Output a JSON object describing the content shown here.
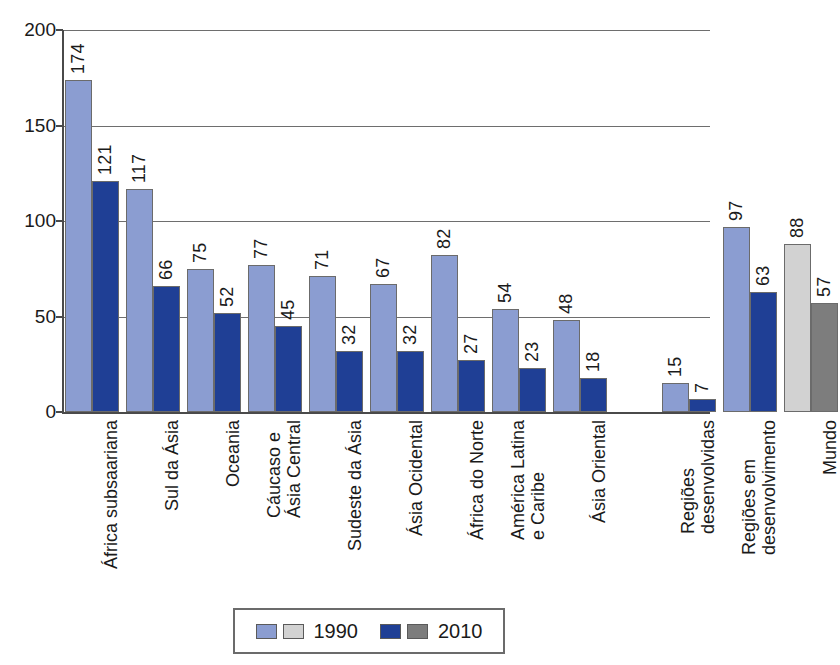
{
  "chart_data": {
    "type": "bar",
    "title": "",
    "subtitle": "",
    "xlabel": "",
    "ylabel": "",
    "ylim": [
      0,
      200
    ],
    "yticks": [
      0,
      50,
      100,
      150,
      200
    ],
    "grid": true,
    "legend_position": "bottom",
    "categories": [
      "África subsaariana",
      "Sul da Ásia",
      "Oceania",
      "Cáucaso e Ásia Central",
      "Sudeste da Ásia",
      "Ásia Ocidental",
      "África do Norte",
      "América Latina e Caribe",
      "Ásia Oriental",
      "Regiões desenvolvidas",
      "Regiões em desenvolvimento",
      "Mundo"
    ],
    "category_lines": [
      [
        "África subsaariana"
      ],
      [
        "Sul da Ásia"
      ],
      [
        "Oceania"
      ],
      [
        "Cáucaso e",
        "Ásia Central"
      ],
      [
        "Sudeste da Ásia"
      ],
      [
        "Ásia Ocidental"
      ],
      [
        "África do Norte"
      ],
      [
        "América Latina",
        "e Caribe"
      ],
      [
        "Ásia Oriental"
      ],
      [
        "Regiões",
        "desenvolvidas"
      ],
      [
        "Regiões em",
        "desenvolvimento"
      ],
      [
        "Mundo"
      ]
    ],
    "series": [
      {
        "name": "1990",
        "color": "#8b9dd1",
        "alt_color": "#d2d2d2",
        "values": [
          174,
          117,
          75,
          77,
          71,
          67,
          82,
          54,
          48,
          15,
          97,
          88
        ]
      },
      {
        "name": "2010",
        "color": "#1f3f95",
        "alt_color": "#7d7d7d",
        "values": [
          121,
          66,
          52,
          45,
          32,
          32,
          27,
          23,
          18,
          7,
          63,
          57
        ]
      }
    ],
    "gray_category_indexes": [
      11
    ],
    "gap_before_category_index": 9
  },
  "legend": {
    "items": [
      {
        "label": "1990",
        "swatch_blue": "#8b9dd1",
        "swatch_gray": "#d2d2d2"
      },
      {
        "label": "2010",
        "swatch_blue": "#1f3f95",
        "swatch_gray": "#7d7d7d"
      }
    ]
  },
  "axis": {
    "y_tick_labels": [
      "200",
      "150",
      "100",
      "50",
      "0"
    ]
  }
}
